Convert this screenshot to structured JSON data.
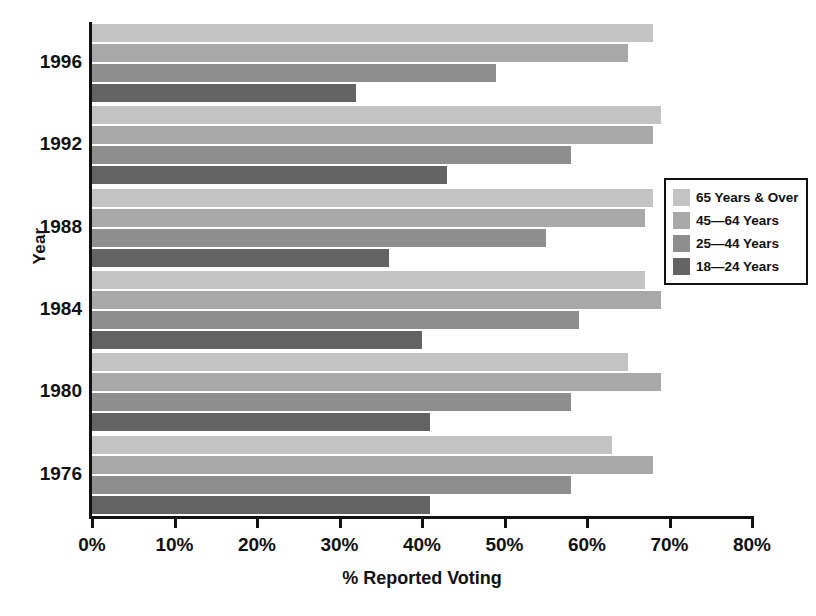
{
  "chart_data": {
    "type": "bar",
    "orientation": "horizontal",
    "title": "",
    "xlabel": "% Reported Voting",
    "ylabel": "Year",
    "xlim": [
      0,
      80
    ],
    "xticks": [
      0,
      10,
      20,
      30,
      40,
      50,
      60,
      70,
      80
    ],
    "xtick_labels": [
      "0%",
      "10%",
      "20%",
      "30%",
      "40%",
      "50%",
      "60%",
      "70%",
      "80%"
    ],
    "grid": false,
    "legend_position": "right",
    "categories": [
      "1996",
      "1992",
      "1988",
      "1984",
      "1980",
      "1976"
    ],
    "series": [
      {
        "name": "65 Years & Over",
        "color": "#c3c3c3",
        "values": [
          68,
          69,
          68,
          67,
          65,
          63
        ]
      },
      {
        "name": "45—64 Years",
        "color": "#a8a8a8",
        "values": [
          65,
          68,
          67,
          69,
          69,
          68
        ]
      },
      {
        "name": "25—44 Years",
        "color": "#8e8e8e",
        "values": [
          49,
          58,
          55,
          59,
          58,
          58
        ]
      },
      {
        "name": "18—24 Years",
        "color": "#636363",
        "values": [
          32,
          43,
          36,
          40,
          41,
          41
        ]
      }
    ]
  },
  "legend": {
    "entries": [
      {
        "label": "65 Years & Over",
        "color": "#c3c3c3"
      },
      {
        "label": "45—64 Years",
        "color": "#a8a8a8"
      },
      {
        "label": "25—44 Years",
        "color": "#8e8e8e"
      },
      {
        "label": "18—24 Years",
        "color": "#636363"
      }
    ]
  },
  "axis": {
    "x_title": "% Reported Voting",
    "y_title": "Year"
  }
}
